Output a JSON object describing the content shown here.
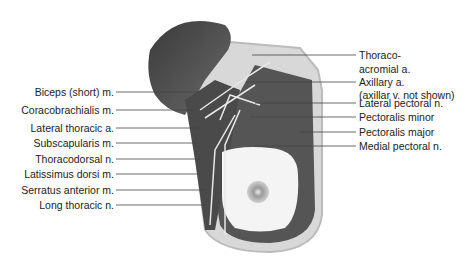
{
  "figure": {
    "labels_left": [
      {
        "text": "Biceps (short) m."
      },
      {
        "text": "Coracobrachialis m."
      },
      {
        "text": "Lateral thoracic a."
      },
      {
        "text": "Subscapularis m."
      },
      {
        "text": "Thoracodorsal n."
      },
      {
        "text": "Latissimus dorsi m."
      },
      {
        "text": "Serratus anterior m."
      },
      {
        "text": "Long thoracic n."
      }
    ],
    "labels_right": [
      {
        "text": "Thoraco-"
      },
      {
        "text": "acromial a."
      },
      {
        "text": "Axillary a."
      },
      {
        "text": "(axillar v. not shown)"
      },
      {
        "text": "Lateral pectoral n."
      },
      {
        "text": "Pectoralis minor"
      },
      {
        "text": "Pectoralis major"
      },
      {
        "text": "Medial pectoral n."
      }
    ]
  }
}
